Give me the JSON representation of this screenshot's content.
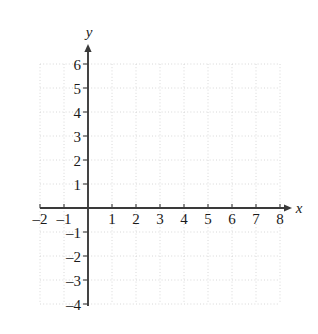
{
  "figure": {
    "kind": "coordinate-plane",
    "background_color": "#ffffff"
  },
  "chart_data": {
    "type": "scatter",
    "title": "",
    "subtitle": "",
    "xlabel": "x",
    "ylabel": "y",
    "xlim": [
      -2,
      8
    ],
    "ylim": [
      -4,
      6
    ],
    "x_tick_labels": [
      "–2",
      "–1",
      "1",
      "2",
      "3",
      "4",
      "5",
      "6",
      "7",
      "8"
    ],
    "x_tick_values": [
      -2,
      -1,
      1,
      2,
      3,
      4,
      5,
      6,
      7,
      8
    ],
    "y_tick_labels": [
      "6",
      "5",
      "4",
      "3",
      "2",
      "1",
      "–1",
      "–2",
      "–3",
      "–4"
    ],
    "y_tick_values": [
      6,
      5,
      4,
      3,
      2,
      1,
      -1,
      -2,
      -3,
      -4
    ],
    "grid": true,
    "grid_style": "dotted",
    "grid_step": 1,
    "legend": null,
    "legend_position": "none",
    "series": [],
    "annotations": [],
    "axis_arrows": [
      "x-positive",
      "y-positive"
    ],
    "origin_label": "",
    "colors": {
      "axis": "#3a3a3a",
      "grid": "#d8d8d8",
      "text": "#1a1a1a",
      "background": "#ffffff"
    }
  },
  "geometry": {
    "origin_px": [
      88,
      208
    ],
    "unit_px": 24,
    "grid_left_px": 40,
    "grid_right_px": 280,
    "grid_top_px": 64,
    "grid_bottom_px": 304,
    "x_arrow_tip_px": 292,
    "y_arrow_tip_px": 44
  },
  "labels": {
    "x_axis_name": "x",
    "y_axis_name": "y"
  }
}
